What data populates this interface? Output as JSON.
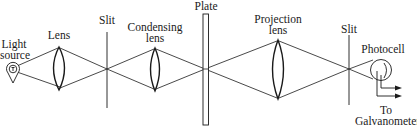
{
  "diagram": {
    "type": "optical-setup",
    "components": {
      "light_source": {
        "label_line1": "Light",
        "label_line2": "source"
      },
      "lens": {
        "label": "Lens"
      },
      "slit1": {
        "label": "Slit"
      },
      "condensing_lens": {
        "label_line1": "Condensing",
        "label_line2": "lens"
      },
      "plate": {
        "label": "Plate"
      },
      "projection_lens": {
        "label_line1": "Projection",
        "label_line2": "lens"
      },
      "slit2": {
        "label": "Slit"
      },
      "photocell": {
        "label": "Photocell"
      },
      "galvanometer": {
        "label_line1": "To",
        "label_line2": "Galvanometer"
      }
    },
    "colors": {
      "stroke": "#1a1a1a",
      "background": "#ffffff"
    }
  }
}
